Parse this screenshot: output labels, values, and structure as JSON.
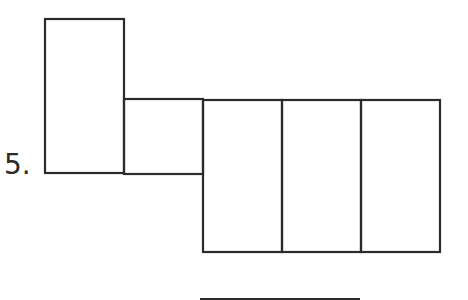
{
  "problem": {
    "number_label": "5."
  },
  "diagram": {
    "type": "net-of-rectangular-prism",
    "stroke_color": "#2b2b2b",
    "shapes": [
      {
        "id": "tall-rect",
        "x": 45,
        "y": 19,
        "w": 79,
        "h": 154
      },
      {
        "id": "small-square",
        "x": 124,
        "y": 99,
        "w": 79,
        "h": 75
      },
      {
        "id": "rect-a",
        "x": 203,
        "y": 100,
        "w": 79,
        "h": 152
      },
      {
        "id": "rect-b",
        "x": 282,
        "y": 100,
        "w": 79,
        "h": 152
      },
      {
        "id": "rect-c",
        "x": 361,
        "y": 100,
        "w": 79,
        "h": 152
      }
    ],
    "answer_line": {
      "x1": 200,
      "y1": 299,
      "x2": 360,
      "y2": 299
    }
  }
}
